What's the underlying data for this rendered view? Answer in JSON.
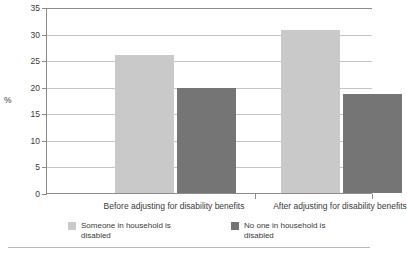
{
  "chart_data": {
    "type": "bar",
    "title": "",
    "xlabel": "",
    "ylabel": "%",
    "ylim": [
      0,
      35
    ],
    "yticks": [
      0,
      5,
      10,
      15,
      20,
      25,
      30,
      35
    ],
    "grid": true,
    "legend_position": "bottom",
    "categories": [
      "Before adjusting for disability benefits",
      "After adjusting for disability benefits"
    ],
    "series": [
      {
        "name": "Someone in household is disabled",
        "color": "#c9c9c9",
        "values": [
          26.0,
          30.7
        ]
      },
      {
        "name": "No one in household is disabled",
        "color": "#757575",
        "values": [
          19.8,
          18.7
        ]
      }
    ]
  },
  "axis": {
    "y_title": "%",
    "tick_labels": [
      "0",
      "5",
      "10",
      "15",
      "20",
      "25",
      "30",
      "35"
    ]
  },
  "categories": {
    "cat0": "Before adjusting for disability benefits",
    "cat1": "After adjusting for disability benefits"
  },
  "legend": {
    "item0": "Someone in household is disabled",
    "item1": "No one in household is disabled"
  }
}
